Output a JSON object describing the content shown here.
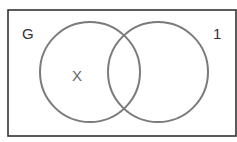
{
  "diagram": {
    "type": "venn",
    "universe_label": "G",
    "corner_label": "1",
    "region_label": "X",
    "sets": [
      {
        "name": "left-circle"
      },
      {
        "name": "right-circle"
      }
    ],
    "colors": {
      "border": "#333333",
      "circle": "#777777",
      "text": "#333333"
    }
  }
}
